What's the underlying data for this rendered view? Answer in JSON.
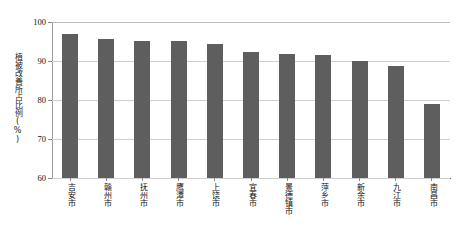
{
  "chart_data": {
    "type": "bar",
    "title": "",
    "xlabel": "",
    "ylabel": "植被改善所占比例(%)",
    "ylim": [
      60,
      100
    ],
    "ytick_labels": [
      "100",
      "90",
      "80",
      "70",
      "60"
    ],
    "ytick_values": [
      100,
      90,
      80,
      70,
      60
    ],
    "grid": true,
    "legend": "none",
    "bar_color": "#5e5e5e",
    "grid_color": "#cfcfcf",
    "axis_color": "#8a8a8a",
    "categories": [
      "吉安市",
      "赣州市",
      "抚州市",
      "鹰潭市",
      "上饶市",
      "宜春市",
      "景德镇市",
      "萍乡市",
      "新余市",
      "九江市",
      "南昌市"
    ],
    "values": [
      97.0,
      95.7,
      95.2,
      95.1,
      94.3,
      92.3,
      91.7,
      91.6,
      90.1,
      88.7,
      79.0
    ]
  }
}
